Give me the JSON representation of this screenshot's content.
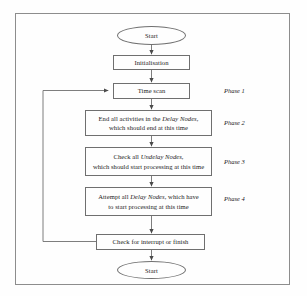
{
  "figure": {
    "type": "flowchart",
    "frame_color": "#8d8d8d",
    "line_color": "#6f6f6f",
    "text_color": "#1b1b1b",
    "background": "#fefefe"
  },
  "nodes": {
    "start_top": {
      "label": "Start",
      "shape": "terminator"
    },
    "initialisation": {
      "label": "Initialisation",
      "shape": "process"
    },
    "time_scan": {
      "label": "Time scan",
      "shape": "process"
    },
    "phase2_box": {
      "line1_pre": "End all activities in the ",
      "line1_em": "Delay Nodes",
      "line1_post": ",",
      "line2": "which should end at this time",
      "shape": "process"
    },
    "phase3_box": {
      "line1_pre": "Check all ",
      "line1_em": "Undelay Nodes",
      "line1_post": ",",
      "line2": "which should start processing at this time",
      "shape": "process"
    },
    "phase4_box": {
      "line1_pre": "Attempt all ",
      "line1_em": "Delay Nodes",
      "line1_post": ", which have",
      "line2": "to start processing at this time",
      "shape": "process"
    },
    "check_interrupt": {
      "label": "Check for interrupt or finish",
      "shape": "process"
    },
    "start_bottom": {
      "label": "Start",
      "shape": "terminator"
    }
  },
  "phase_labels": [
    {
      "label": "Phase 1"
    },
    {
      "label": "Phase 2"
    },
    {
      "label": "Phase 3"
    },
    {
      "label": "Phase 4"
    }
  ],
  "connectors": [
    {
      "name": "start-to-initialisation",
      "kind": "arrow-down"
    },
    {
      "name": "initialisation-to-time-scan",
      "kind": "arrow-down"
    },
    {
      "name": "time-scan-to-phase2",
      "kind": "arrow-down"
    },
    {
      "name": "phase2-to-phase3",
      "kind": "arrow-down"
    },
    {
      "name": "phase3-to-phase4",
      "kind": "arrow-down"
    },
    {
      "name": "phase4-to-check-interrupt",
      "kind": "arrow-down"
    },
    {
      "name": "check-interrupt-to-start-bottom",
      "kind": "arrow-down"
    },
    {
      "name": "feedback-loop-to-time-scan",
      "kind": "arrow-loop-left"
    }
  ]
}
